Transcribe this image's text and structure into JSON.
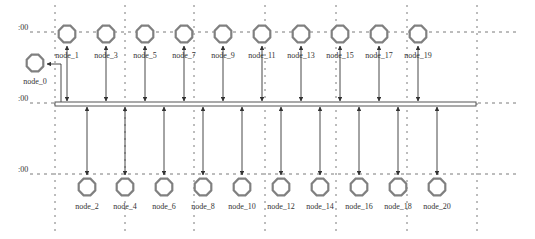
{
  "diagram": {
    "type": "bus-topology",
    "colors": {
      "background": "#ffffff",
      "grid": "#7a7a7a",
      "node_stroke": "#808080",
      "edge": "#333333",
      "bus": "#555555",
      "text": "#333333"
    },
    "grid": {
      "row_labels": [
        {
          "text": ":00",
          "y": 32
        },
        {
          "text": ":00",
          "y": 103
        },
        {
          "text": ":00",
          "y": 174
        }
      ],
      "vertical_lines_x": [
        55,
        125,
        194,
        265,
        336,
        407,
        477
      ],
      "horizontal_lines": [
        {
          "y": 32,
          "x1": 30,
          "x2": 520
        },
        {
          "y": 103,
          "x1": 30,
          "x2": 520
        },
        {
          "y": 174,
          "x1": 30,
          "x2": 520
        }
      ],
      "vertical_extent": [
        5,
        235
      ]
    },
    "bus": {
      "x1": 55,
      "x2": 476,
      "y": 104
    },
    "node_0": {
      "label": "node_0",
      "x": 35,
      "y": 63,
      "label_y": 84
    },
    "top_nodes": [
      {
        "label": "node_1",
        "x": 67
      },
      {
        "label": "node_3",
        "x": 106
      },
      {
        "label": "node_5",
        "x": 145
      },
      {
        "label": "node_7",
        "x": 184
      },
      {
        "label": "node_9",
        "x": 223
      },
      {
        "label": "node_11",
        "x": 262
      },
      {
        "label": "node_13",
        "x": 301
      },
      {
        "label": "node_15",
        "x": 340
      },
      {
        "label": "node_17",
        "x": 379
      },
      {
        "label": "node_19",
        "x": 418
      }
    ],
    "bottom_nodes": [
      {
        "label": "node_2",
        "x": 87
      },
      {
        "label": "node_4",
        "x": 125
      },
      {
        "label": "node_6",
        "x": 164
      },
      {
        "label": "node_8",
        "x": 203
      },
      {
        "label": "node_10",
        "x": 242
      },
      {
        "label": "node_12",
        "x": 281
      },
      {
        "label": "node_14",
        "x": 320
      },
      {
        "label": "node_16",
        "x": 359
      },
      {
        "label": "node_18",
        "x": 398
      },
      {
        "label": "node_20",
        "x": 437
      }
    ],
    "top_row": {
      "node_y": 34,
      "label_y": 58
    },
    "bottom_row": {
      "node_y": 187,
      "label_y": 203
    }
  }
}
